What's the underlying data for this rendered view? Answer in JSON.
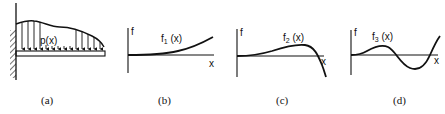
{
  "figure": {
    "panels": [
      {
        "id": "a",
        "caption": "(a)",
        "type": "cantilever-beam-distributed-load",
        "load_label": "p(x)"
      },
      {
        "id": "b",
        "caption": "(b)",
        "type": "function-plot",
        "y_axis_label": "f",
        "x_axis_label": "x",
        "curve_label_main": "f",
        "curve_label_sub": "1",
        "curve_label_suffix": " (x)"
      },
      {
        "id": "c",
        "caption": "(c)",
        "type": "function-plot",
        "y_axis_label": "f",
        "x_axis_label": "x",
        "curve_label_main": "f",
        "curve_label_sub": "2",
        "curve_label_suffix": " (x)"
      },
      {
        "id": "d",
        "caption": "(d)",
        "type": "function-plot",
        "y_axis_label": "f",
        "x_axis_label": "x",
        "curve_label_main": "f",
        "curve_label_sub": "3",
        "curve_label_suffix": " (x)"
      }
    ],
    "colors": {
      "ink": "#111111",
      "background": "#ffffff"
    }
  }
}
